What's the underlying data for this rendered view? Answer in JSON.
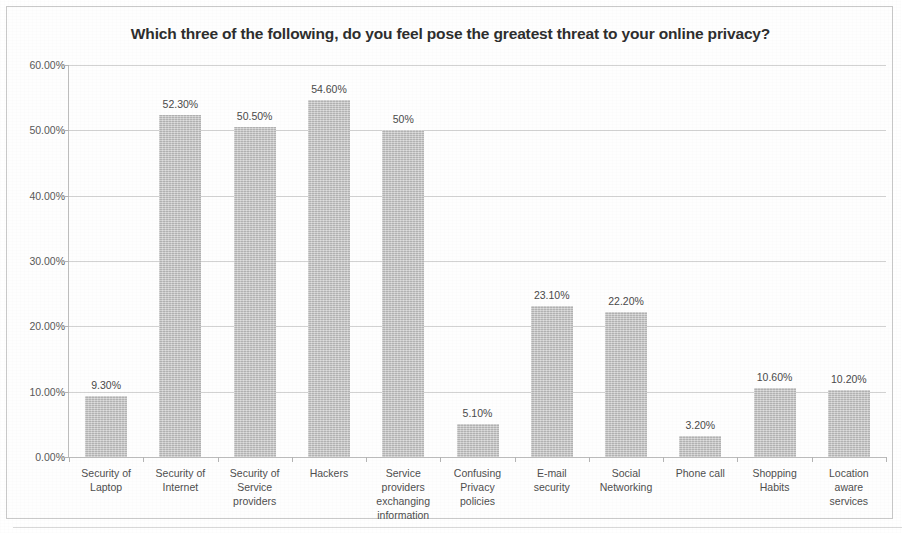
{
  "chart_data": {
    "type": "bar",
    "title": "Which three of the following, do you feel pose the greatest threat to your online privacy?",
    "xlabel": "",
    "ylabel": "",
    "ylim": [
      0,
      60
    ],
    "grid": true,
    "legend": false,
    "y_tick_labels": [
      "0.00%",
      "10.00%",
      "20.00%",
      "30.00%",
      "40.00%",
      "50.00%",
      "60.00%"
    ],
    "y_tick_values": [
      0,
      10,
      20,
      30,
      40,
      50,
      60
    ],
    "categories": [
      "Security of Laptop",
      "Security of Internet",
      "Security of Service providers",
      "Hackers",
      "Service providers exchanging information",
      "Confusing Privacy policies",
      "E-mail security",
      "Social Networking",
      "Phone call",
      "Shopping Habits",
      "Location aware services"
    ],
    "category_lines": [
      [
        "Security of",
        "Laptop"
      ],
      [
        "Security of",
        "Internet"
      ],
      [
        "Security of",
        "Service",
        "providers"
      ],
      [
        "Hackers"
      ],
      [
        "Service",
        "providers",
        "exchanging",
        "information"
      ],
      [
        "Confusing",
        "Privacy",
        "policies"
      ],
      [
        "E-mail",
        "security"
      ],
      [
        "Social",
        "Networking"
      ],
      [
        "Phone call"
      ],
      [
        "Shopping",
        "Habits"
      ],
      [
        "Location",
        "aware",
        "services"
      ]
    ],
    "values": [
      9.3,
      52.3,
      50.5,
      54.6,
      50.0,
      5.1,
      23.1,
      22.2,
      3.2,
      10.6,
      10.2
    ],
    "value_labels": [
      "9.30%",
      "52.30%",
      "50.50%",
      "54.60%",
      "50%",
      "5.10%",
      "23.10%",
      "22.20%",
      "3.20%",
      "10.60%",
      "10.20%"
    ],
    "bar_color": "#c4c4c4",
    "gridline_color": "#d2d2d2",
    "text_color": "#4f4f4f"
  }
}
